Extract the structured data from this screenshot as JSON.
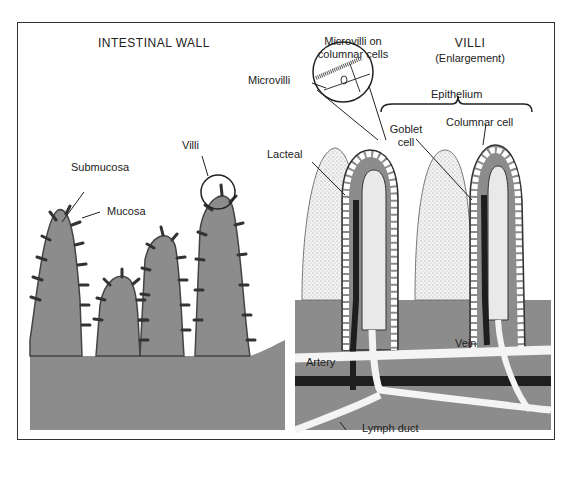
{
  "left_panel": {
    "title": "INTESTINAL WALL",
    "labels": {
      "villi": "Villi",
      "submucosa": "Submucosa",
      "mucosa": "Mucosa"
    }
  },
  "right_panel": {
    "title": "VILLI",
    "subtitle": "(Enlargement)",
    "labels": {
      "microvilli_on_columnar_line1": "Microvilli on",
      "microvilli_on_columnar_line2": "columnar cells",
      "microvilli": "Microvilli",
      "epithelium": "Epithelium",
      "goblet_line1": "Goblet",
      "goblet_line2": "cell",
      "columnar_cell": "Columnar cell",
      "lacteal": "Lacteal",
      "artery": "Artery",
      "vein": "Vein",
      "lymph_duct": "Lymph duct"
    }
  },
  "colors": {
    "tissue_gray": "#8c8c8c",
    "dark_vessel": "#1e1e1e",
    "light_vessel": "#f4f4f4",
    "outline": "#222222",
    "stipple": "#e9e9e9"
  }
}
